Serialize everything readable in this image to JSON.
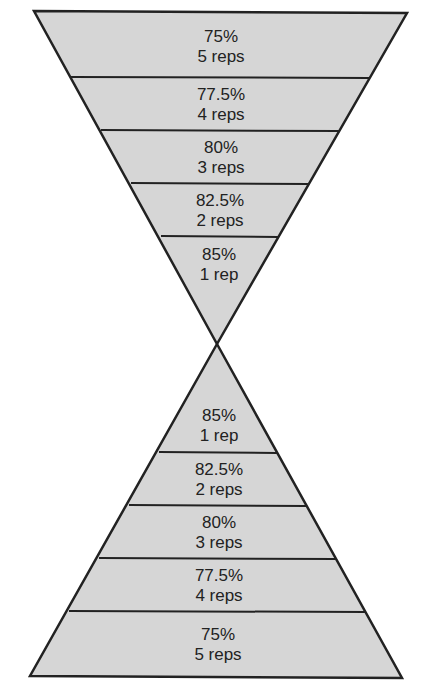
{
  "diagram": {
    "type": "double pyramid (hourglass)",
    "fill_color": "#d6d6d6",
    "stroke_color": "#222222",
    "top_pyramid": {
      "orientation": "inverted",
      "tiers": [
        {
          "percent": "75%",
          "reps": "5 reps"
        },
        {
          "percent": "77.5%",
          "reps": "4 reps"
        },
        {
          "percent": "80%",
          "reps": "3 reps"
        },
        {
          "percent": "82.5%",
          "reps": "2 reps"
        },
        {
          "percent": "85%",
          "reps": "1 rep"
        }
      ]
    },
    "bottom_pyramid": {
      "orientation": "upright",
      "tiers": [
        {
          "percent": "85%",
          "reps": "1 rep"
        },
        {
          "percent": "82.5%",
          "reps": "2 reps"
        },
        {
          "percent": "80%",
          "reps": "3 reps"
        },
        {
          "percent": "77.5%",
          "reps": "4 reps"
        },
        {
          "percent": "75%",
          "reps": "5 reps"
        }
      ]
    }
  }
}
